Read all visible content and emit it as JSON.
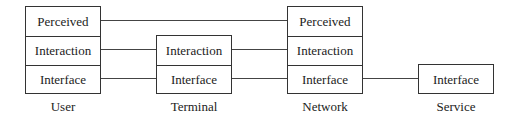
{
  "diagram": {
    "nodes": [
      {
        "id": "user",
        "label": "User",
        "layers": [
          "Perceived",
          "Interaction",
          "Interface"
        ]
      },
      {
        "id": "terminal",
        "label": "Terminal",
        "layers": [
          "Interaction",
          "Interface"
        ]
      },
      {
        "id": "network",
        "label": "Network",
        "layers": [
          "Perceived",
          "Interaction",
          "Interface"
        ]
      },
      {
        "id": "service",
        "label": "Service",
        "layers": [
          "Interface"
        ]
      }
    ],
    "connections": [
      {
        "from": "user.Perceived",
        "to": "network.Perceived"
      },
      {
        "from": "user.Interaction",
        "to": "terminal.Interaction"
      },
      {
        "from": "terminal.Interaction",
        "to": "network.Interaction"
      },
      {
        "from": "user.Interface",
        "to": "terminal.Interface"
      },
      {
        "from": "terminal.Interface",
        "to": "network.Interface"
      },
      {
        "from": "network.Interface",
        "to": "service.Interface"
      }
    ]
  }
}
